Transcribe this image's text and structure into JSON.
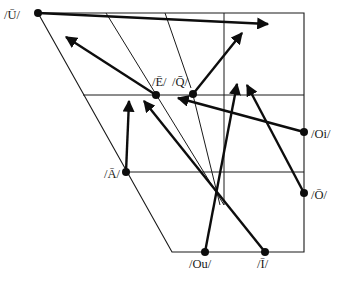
{
  "diagram": {
    "type": "vowel-shift-chart",
    "frame": {
      "top_left": [
        38,
        13
      ],
      "top_right": [
        304,
        13
      ],
      "bottom_left": [
        172,
        252
      ],
      "bottom_right": [
        304,
        252
      ],
      "horizontals": [
        {
          "y": 95,
          "x1": 83,
          "x2": 304
        },
        {
          "y": 172,
          "x1": 126,
          "x2": 304
        }
      ],
      "verticals": [
        {
          "x": 224,
          "y1": 13,
          "y2": 205
        }
      ],
      "interior_slants": [
        {
          "x1": 106,
          "y1": 13,
          "x2": 224,
          "y2": 205
        },
        {
          "x1": 165,
          "y1": 13,
          "x2": 191,
          "y2": 88
        },
        {
          "x1": 193,
          "y1": 95,
          "x2": 220,
          "y2": 205
        }
      ]
    },
    "nodes": [
      {
        "id": "U",
        "label": "/Ū/",
        "x": 38,
        "y": 13,
        "label_x": 4,
        "label_y": 19
      },
      {
        "id": "E",
        "label": "/Ē/",
        "x": 156,
        "y": 95,
        "label_x": 152,
        "label_y": 86
      },
      {
        "id": "Q",
        "label": "/Q̄/",
        "x": 193,
        "y": 94,
        "label_x": 172,
        "label_y": 86
      },
      {
        "id": "A",
        "label": "/Ā/",
        "x": 126,
        "y": 172,
        "label_x": 104,
        "label_y": 178
      },
      {
        "id": "Oi",
        "label": "/Oi/",
        "x": 304,
        "y": 132,
        "label_x": 311,
        "label_y": 138
      },
      {
        "id": "O",
        "label": "/Ō/",
        "x": 304,
        "y": 193,
        "label_x": 311,
        "label_y": 199
      },
      {
        "id": "Ou",
        "label": "/Ou/",
        "x": 205,
        "y": 252,
        "label_x": 189,
        "label_y": 268
      },
      {
        "id": "I",
        "label": "/Ī/",
        "x": 265,
        "y": 252,
        "label_x": 257,
        "label_y": 268
      }
    ],
    "arrows": [
      {
        "from": "U",
        "x1": 38,
        "y1": 13,
        "x2": 268,
        "y2": 24
      },
      {
        "from": "E",
        "x1": 156,
        "y1": 95,
        "x2": 66,
        "y2": 37
      },
      {
        "from": "Q",
        "x1": 193,
        "y1": 94,
        "x2": 242,
        "y2": 33
      },
      {
        "from": "A",
        "x1": 126,
        "y1": 172,
        "x2": 129,
        "y2": 101
      },
      {
        "from": "I",
        "x1": 265,
        "y1": 252,
        "x2": 144,
        "y2": 101
      },
      {
        "from": "Oi",
        "x1": 304,
        "y1": 132,
        "x2": 178,
        "y2": 98
      },
      {
        "from": "Ou",
        "x1": 205,
        "y1": 252,
        "x2": 237,
        "y2": 84
      },
      {
        "from": "O",
        "x1": 304,
        "y1": 193,
        "x2": 247,
        "y2": 85
      }
    ]
  }
}
